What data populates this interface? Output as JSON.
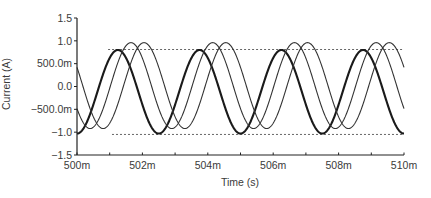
{
  "chart_data": {
    "type": "line",
    "title": "",
    "xlabel": "Time (s)",
    "ylabel": "Current (A)",
    "xlim": [
      0.5,
      0.51
    ],
    "ylim": [
      -1.5,
      1.5
    ],
    "x_ticks": [
      0.5,
      0.502,
      0.504,
      0.506,
      0.508,
      0.51
    ],
    "x_tick_labels": [
      "500m",
      "502m",
      "504m",
      "506m",
      "508m",
      "510m"
    ],
    "x_minor_step": 0.001,
    "y_ticks": [
      1.5,
      1.0,
      0.5,
      0.0,
      -0.5,
      -1.0,
      -1.5
    ],
    "y_tick_labels": [
      "1.5",
      "1.0",
      "500.0m",
      "0.0",
      "-500.0m",
      "-1.0",
      "-1.5"
    ],
    "grid": false,
    "legend": null,
    "series": [
      {
        "name": "bold trace",
        "style": "bold",
        "frequency_hz": 400,
        "offset": -0.115,
        "amplitude": 0.915,
        "peak_time": 0.50125,
        "description": "sinusoid, trough at 500m and 510m, peak ~0.8, trough ~-1.03"
      },
      {
        "name": "thin trace A",
        "style": "thin",
        "frequency_hz": 400,
        "offset": 0.02,
        "amplitude": 0.94,
        "peak_time": 0.50165,
        "description": "sinusoid lagging bold by ~0.4 ms, peak ~0.96, trough ~-0.92"
      },
      {
        "name": "thin trace B",
        "style": "thin",
        "frequency_hz": 400,
        "offset": 0.02,
        "amplitude": 0.94,
        "peak_time": 0.50205,
        "description": "sinusoid lagging bold by ~0.8 ms, peak ~0.96, trough ~-0.92"
      }
    ],
    "reference_lines": [
      {
        "name": "upper envelope",
        "y": 0.81,
        "x_start": 0.50095,
        "x_end": 0.50995,
        "style": "dashed"
      },
      {
        "name": "lower envelope",
        "y": -1.05,
        "x_start": 0.50107,
        "x_end": 0.50995,
        "style": "dashed"
      }
    ],
    "plot_area_px": {
      "x0": 77,
      "x1": 404,
      "y_top": 18,
      "y_bottom": 155
    }
  }
}
